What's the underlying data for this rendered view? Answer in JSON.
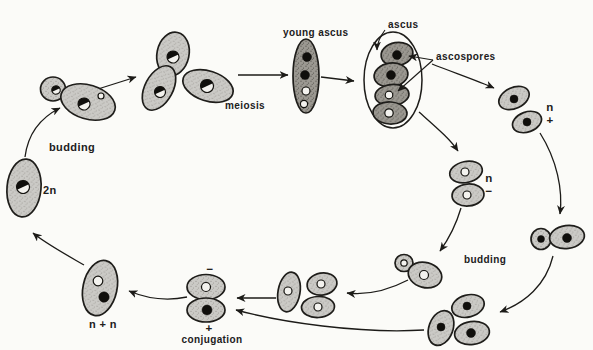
{
  "figure": {
    "labels": {
      "budding_top": "budding",
      "meiosis": "meiosis",
      "young_ascus": "young ascus",
      "ascus": "ascus",
      "ascospores": "ascospores",
      "n_plus": {
        "top": "n",
        "bottom": "+"
      },
      "n_minus": {
        "top": "n",
        "bottom": "−"
      },
      "budding_right": "budding",
      "conj_minus": "−",
      "conj_plus": "+",
      "conjugation": "conjugation",
      "n_plus_n": "n + n",
      "two_n": "2n"
    },
    "colors": {
      "background": "#fbfbf8",
      "cell_light_fill": "#cbcac6",
      "cell_dark_fill": "#9b9891",
      "outline": "#1e1d1a",
      "text": "#21201c"
    }
  }
}
